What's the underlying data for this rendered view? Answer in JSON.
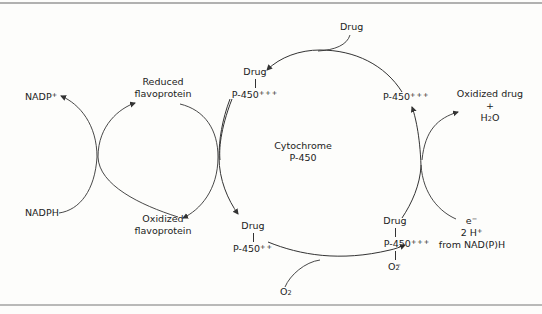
{
  "figure": {
    "center_label": {
      "line1": "Cytochrome",
      "line2": "P-450"
    },
    "left_cycle": {
      "nadp_plus": {
        "base": "NADP",
        "sup": "+"
      },
      "nadph": "NADPH",
      "reduced": {
        "line1": "Reduced",
        "line2": "flavoprotein"
      },
      "oxidized": {
        "line1": "Oxidized",
        "line2": "flavoprotein"
      }
    },
    "p450_cycle": {
      "drug_input_top": "Drug",
      "complex_top_left": {
        "drug": "Drug",
        "enzyme": "P-450",
        "charge": "+++"
      },
      "free_enzyme_top_right": {
        "enzyme": "P-450",
        "charge": "+++"
      },
      "products": {
        "line1": "Oxidized drug",
        "plus": "+",
        "water_base": "H",
        "water_sub": "2",
        "water_end": "O"
      },
      "electrons_input": {
        "e": "e",
        "e_sup": "−",
        "protons": "2 H",
        "protons_sup": "+",
        "source": "from NAD(P)H"
      },
      "complex_bottom_right": {
        "drug": "Drug",
        "enzyme": "P-450",
        "charge": "+++",
        "oxygen_base": "O",
        "oxygen_sub": "2",
        "oxygen_sup": "−"
      },
      "complex_bottom_left": {
        "drug": "Drug",
        "enzyme": "P-450",
        "charge": "++"
      },
      "oxygen_input": {
        "base": "O",
        "sub": "2"
      }
    }
  }
}
